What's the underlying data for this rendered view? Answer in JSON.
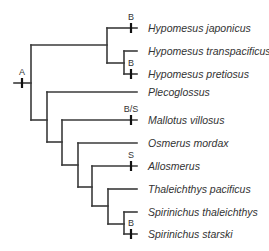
{
  "diagram": {
    "type": "phylogenetic-tree",
    "colors": {
      "line": "#3a3a3a",
      "tick": "#111111",
      "text": "#333333",
      "background": "#ffffff"
    },
    "root": {
      "label": "A",
      "x1": 14,
      "x2": 31,
      "y": 83,
      "tick_x": 22
    },
    "branches": [
      {
        "id": "root-vert",
        "x1": 31,
        "y1": 45,
        "x2": 31,
        "y2": 120
      },
      {
        "id": "to-hypomesus",
        "x1": 31,
        "y1": 45,
        "x2": 107,
        "y2": 45
      },
      {
        "id": "hyp-vert",
        "x1": 107,
        "y1": 28,
        "x2": 107,
        "y2": 63
      },
      {
        "id": "hyp-inner-h",
        "x1": 107,
        "y1": 63,
        "x2": 124,
        "y2": 63
      },
      {
        "id": "hyp-inner-vert",
        "x1": 124,
        "y1": 51,
        "x2": 124,
        "y2": 74
      },
      {
        "id": "to-clade2",
        "x1": 31,
        "y1": 120,
        "x2": 47,
        "y2": 120
      },
      {
        "id": "c2-vert",
        "x1": 47,
        "y1": 92,
        "x2": 47,
        "y2": 142
      },
      {
        "id": "to-clade3",
        "x1": 47,
        "y1": 142,
        "x2": 62,
        "y2": 142
      },
      {
        "id": "c3-vert",
        "x1": 62,
        "y1": 120,
        "x2": 62,
        "y2": 165
      },
      {
        "id": "to-clade4",
        "x1": 62,
        "y1": 165,
        "x2": 78,
        "y2": 165
      },
      {
        "id": "c4-vert",
        "x1": 78,
        "y1": 143,
        "x2": 78,
        "y2": 187
      },
      {
        "id": "to-clade5",
        "x1": 78,
        "y1": 187,
        "x2": 92,
        "y2": 187
      },
      {
        "id": "c5-vert",
        "x1": 92,
        "y1": 166,
        "x2": 92,
        "y2": 206
      },
      {
        "id": "to-clade6",
        "x1": 92,
        "y1": 206,
        "x2": 108,
        "y2": 206
      },
      {
        "id": "c6-vert",
        "x1": 108,
        "y1": 189,
        "x2": 108,
        "y2": 224
      },
      {
        "id": "to-spirinchus",
        "x1": 108,
        "y1": 224,
        "x2": 124,
        "y2": 224
      },
      {
        "id": "spir-vert",
        "x1": 124,
        "y1": 212,
        "x2": 124,
        "y2": 234
      }
    ],
    "leaves": [
      {
        "name": "Hypomesus japonicus",
        "x_start": 107,
        "y": 28,
        "event": "B"
      },
      {
        "name": "Hypomesus transpacificus",
        "x_start": 124,
        "y": 51,
        "event": ""
      },
      {
        "name": "Hypomesus pretiosus",
        "x_start": 124,
        "y": 74,
        "event": "B"
      },
      {
        "name": "Plecoglossus",
        "x_start": 47,
        "y": 92,
        "event": ""
      },
      {
        "name": "Mallotus villosus",
        "x_start": 62,
        "y": 120,
        "event": "B/S"
      },
      {
        "name": "Osmerus mordax",
        "x_start": 78,
        "y": 143,
        "event": ""
      },
      {
        "name": "Allosmerus",
        "x_start": 92,
        "y": 166,
        "event": "S"
      },
      {
        "name": "Thaleichthys pacificus",
        "x_start": 108,
        "y": 189,
        "event": ""
      },
      {
        "name": "Spirinichus thaleichthys",
        "x_start": 124,
        "y": 212,
        "event": ""
      },
      {
        "name": "Spirinichus starski",
        "x_start": 124,
        "y": 234,
        "event": "B"
      }
    ],
    "leaf_end_x": 137,
    "tick_x": 131,
    "label_x": 148
  }
}
